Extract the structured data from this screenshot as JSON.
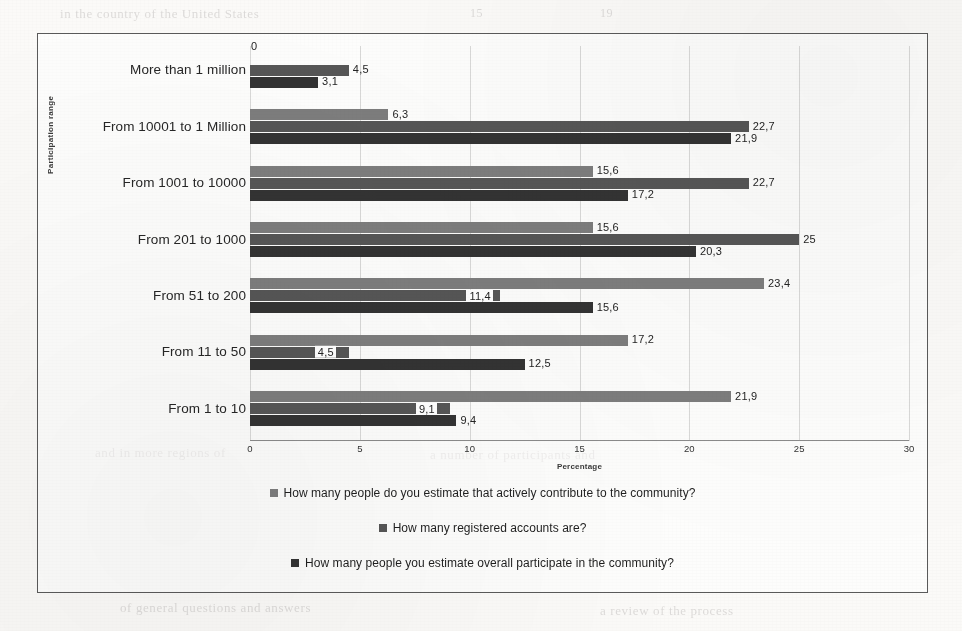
{
  "chart_data": {
    "type": "bar",
    "orientation": "horizontal",
    "title": "",
    "xlabel": "Percentage",
    "ylabel": "Participation range",
    "xlim": [
      0,
      30
    ],
    "xticks": [
      "0",
      "5",
      "10",
      "15",
      "20",
      "25",
      "30"
    ],
    "grid": true,
    "legend_position": "bottom",
    "categories": [
      "More than 1 million",
      "From 10001 to 1 Million",
      "From 1001 to 10000",
      "From 201 to 1000",
      "From 51 to 200",
      "From 11 to 50",
      "From 1 to 10"
    ],
    "series": [
      {
        "name": "How many people do you estimate that actively contribute to the community?",
        "color": "#7d7d7d",
        "values": [
          0,
          6.3,
          15.6,
          15.6,
          23.4,
          17.2,
          21.9
        ],
        "labels": [
          "0",
          "6,3",
          "15,6",
          "15,6",
          "23,4",
          "17,2",
          "21,9"
        ]
      },
      {
        "name": "How many registered accounts are?",
        "color": "#565656",
        "values": [
          4.5,
          22.7,
          22.7,
          25,
          11.4,
          4.5,
          9.1
        ],
        "labels": [
          "4,5",
          "22,7",
          "22,7",
          "25",
          "11,4",
          "4,5",
          "9,1"
        ]
      },
      {
        "name": "How many people you estimate overall participate in the community?",
        "color": "#333333",
        "values": [
          3.1,
          21.9,
          17.2,
          20.3,
          15.6,
          12.5,
          9.4
        ],
        "labels": [
          "3,1",
          "21,9",
          "17,2",
          "20,3",
          "15,6",
          "12,5",
          "9,4"
        ]
      }
    ]
  },
  "background_text": [
    {
      "text": "in the country of the United States",
      "x": 60,
      "y": 6,
      "size": 13
    },
    {
      "text": "15",
      "x": 470,
      "y": 6,
      "size": 12
    },
    {
      "text": "19",
      "x": 600,
      "y": 6,
      "size": 12
    },
    {
      "text": "and in more regions of",
      "x": 95,
      "y": 445,
      "size": 13
    },
    {
      "text": "a number of participants and",
      "x": 430,
      "y": 447,
      "size": 13
    },
    {
      "text": "of general questions and answers",
      "x": 120,
      "y": 600,
      "size": 13
    },
    {
      "text": "a review of the process",
      "x": 600,
      "y": 603,
      "size": 13
    }
  ]
}
